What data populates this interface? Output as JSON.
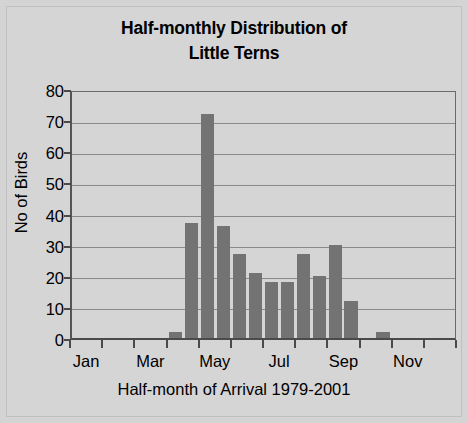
{
  "chart_data": {
    "type": "bar",
    "title": "Half-monthly Distribution of Little Terns",
    "title_lines": [
      "Half-monthly Distribution of",
      "Little Terns"
    ],
    "xlabel": "Half-month of Arrival 1979-2001",
    "ylabel": "No of Birds",
    "ylim": [
      0,
      80
    ],
    "ytick_values": [
      80,
      70,
      60,
      50,
      40,
      30,
      20,
      10,
      0
    ],
    "ytick_labels": [
      "80",
      "70",
      "60",
      "50",
      "40",
      "30",
      "20",
      "10",
      "0"
    ],
    "grid": true,
    "legend": "none",
    "bar_color": "#737373",
    "plot_background": "#d5d5d5",
    "categories": [
      "Jan 1",
      "Jan 2",
      "Feb 1",
      "Feb 2",
      "Mar 1",
      "Mar 2",
      "Apr 1",
      "Apr 2",
      "May 1",
      "May 2",
      "Jun 1",
      "Jun 2",
      "Jul 1",
      "Jul 2",
      "Aug 1",
      "Aug 2",
      "Sep 1",
      "Sep 2",
      "Oct 1",
      "Oct 2",
      "Nov 1",
      "Nov 2",
      "Dec 1",
      "Dec 2"
    ],
    "values": [
      0,
      0,
      0,
      0,
      0,
      0,
      2,
      37,
      72,
      36,
      27,
      21,
      18,
      18,
      27,
      20,
      30,
      12,
      0,
      2,
      0,
      0,
      0,
      0
    ],
    "xtick_labels": [
      "Jan",
      "Mar",
      "May",
      "Jul",
      "Sep",
      "Nov"
    ],
    "xtick_categories": [
      "Jan 1",
      "Mar 1",
      "May 1",
      "Jul 1",
      "Sep 1",
      "Nov 1"
    ]
  }
}
